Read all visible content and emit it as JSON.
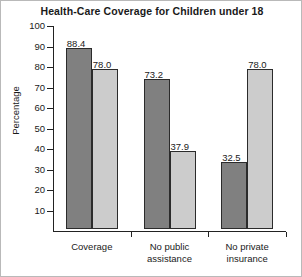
{
  "chart_data": {
    "type": "bar",
    "title": "Health-Care Coverage for Children under 18",
    "xlabel": "",
    "ylabel": "Percentage",
    "ylim": [
      0,
      100
    ],
    "yticks": [
      10,
      20,
      30,
      40,
      50,
      60,
      70,
      80,
      90,
      100
    ],
    "grid": false,
    "legend": "none",
    "categories": [
      "Coverage",
      "No public\nassistance",
      "No private\ninsurance"
    ],
    "series": [
      {
        "name": "dark",
        "color": "#808080",
        "values": [
          88.4,
          73.2,
          32.5
        ],
        "labels": [
          "88.4",
          "73.2",
          "32.5"
        ]
      },
      {
        "name": "light",
        "color": "#cccccc",
        "values": [
          78.0,
          37.9,
          78.0
        ],
        "labels": [
          "78.0",
          "37.9",
          "78.0"
        ]
      }
    ]
  },
  "axis": {
    "y_title": "Percentage",
    "y_tick_labels": [
      "100",
      "90",
      "80",
      "70",
      "60",
      "50",
      "40",
      "30",
      "20",
      "10"
    ],
    "x_tick_labels": [
      "Coverage",
      "No public\nassistance",
      "No private\ninsurance"
    ]
  },
  "values": {
    "g1_dark": "88.4",
    "g1_light": "78.0",
    "g2_dark": "73.2",
    "g2_light": "37.9",
    "g3_dark": "32.5",
    "g3_light": "78.0"
  },
  "colors": {
    "dark_bar": "#808080",
    "light_bar": "#cccccc",
    "outline": "#2b2b2b",
    "text": "#1a1a1a"
  },
  "title": "Health-Care Coverage for Children under 18"
}
